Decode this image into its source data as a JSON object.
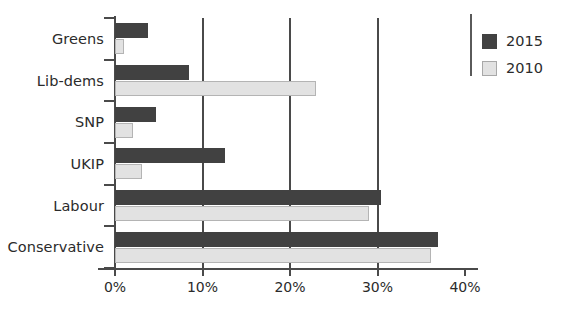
{
  "chart_data": {
    "type": "bar",
    "orientation": "horizontal",
    "title": "",
    "subtitle": "",
    "xlabel": "",
    "ylabel": "",
    "categories": [
      "Greens",
      "Lib-dems",
      "SNP",
      "UKIP",
      "Labour",
      "Conservative"
    ],
    "series": [
      {
        "name": "2015",
        "color": "#414141",
        "values": [
          3.8,
          8.5,
          4.7,
          12.6,
          30.4,
          36.9
        ]
      },
      {
        "name": "2010",
        "color": "#e2e2e2",
        "values": [
          1.0,
          23.0,
          2.0,
          3.1,
          29.0,
          36.1
        ]
      }
    ],
    "xlim": [
      0,
      40
    ],
    "xticks": [
      0,
      10,
      20,
      30,
      40
    ],
    "xtick_labels": [
      "0%",
      "10%",
      "20%",
      "30%",
      "40%"
    ],
    "gridlines_at": [
      10,
      20,
      30
    ],
    "grid": true,
    "legend_position": "top-right",
    "value_suffix": "%"
  },
  "legend": {
    "entries": [
      {
        "label": "2015"
      },
      {
        "label": "2010"
      }
    ]
  },
  "axis": {
    "tick_labels": [
      "0%",
      "10%",
      "20%",
      "30%",
      "40%"
    ]
  }
}
